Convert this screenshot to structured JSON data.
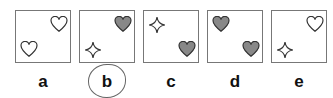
{
  "puzzle": {
    "options": [
      {
        "label": "a",
        "shapes": [
          {
            "type": "heart",
            "fill": "outline",
            "pos": "top-right"
          },
          {
            "type": "heart",
            "fill": "outline",
            "pos": "bottom-left"
          }
        ]
      },
      {
        "label": "b",
        "shapes": [
          {
            "type": "heart",
            "fill": "gray",
            "pos": "top-right"
          },
          {
            "type": "star",
            "fill": "outline",
            "pos": "bottom-left"
          }
        ]
      },
      {
        "label": "c",
        "shapes": [
          {
            "type": "star",
            "fill": "outline",
            "pos": "top-left"
          },
          {
            "type": "heart",
            "fill": "gray",
            "pos": "bottom-right"
          }
        ]
      },
      {
        "label": "d",
        "shapes": [
          {
            "type": "heart",
            "fill": "gray",
            "pos": "top-left"
          },
          {
            "type": "heart",
            "fill": "gray",
            "pos": "bottom-right"
          }
        ]
      },
      {
        "label": "e",
        "shapes": [
          {
            "type": "heart",
            "fill": "outline",
            "pos": "top-right"
          },
          {
            "type": "star",
            "fill": "outline",
            "pos": "bottom-left"
          }
        ]
      }
    ],
    "selected": "b",
    "colors": {
      "border": "#777777",
      "gray_fill": "#888888",
      "stroke": "#333333"
    }
  }
}
